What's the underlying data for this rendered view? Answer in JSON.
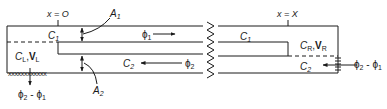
{
  "figure": {
    "type": "channel-flow diagram",
    "labels": {
      "x_left": "x = O",
      "x_right": "x = X",
      "area_1": "A",
      "area_1_sub": "1",
      "area_2": "A",
      "area_2_sub": "2",
      "c1_left": "C",
      "c1_left_sub": "1",
      "c1_right": "C",
      "c1_right_sub": "1",
      "c2_left": "C",
      "c2_left_sub": "2",
      "c2_right": "C",
      "c2_right_sub": "2",
      "phi1": "ϕ",
      "phi1_sub": "1",
      "phi2": "ϕ",
      "phi2_sub": "2",
      "left_reservoir": {
        "c": "C",
        "c_sub": "L",
        "v": "V",
        "v_sub": "L"
      },
      "right_reservoir": {
        "c": "C",
        "c_sub": "R",
        "v": "V",
        "v_sub": "R"
      },
      "left_outflow": {
        "a": "ϕ",
        "a_sub": "2",
        "sep": " - ",
        "b": "ϕ",
        "b_sub": "1"
      },
      "right_inflow": {
        "a": "ϕ",
        "a_sub": "2",
        "sep": " - ",
        "b": "ϕ",
        "b_sub": "1"
      }
    },
    "colors": {
      "stroke": "#1a1a1a",
      "background": "#ffffff"
    }
  }
}
